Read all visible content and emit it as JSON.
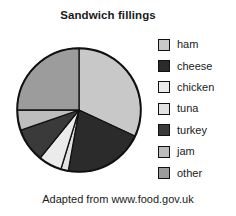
{
  "chart_data": {
    "type": "pie",
    "title": "Sandwich fillings",
    "caption": "Adapted from www.food.gov.uk",
    "xlabel": "",
    "ylabel": "",
    "legend_position": "right",
    "grid": false,
    "start_angle_deg": 0,
    "direction": "clockwise",
    "categories": [
      "ham",
      "cheese",
      "chicken",
      "tuna",
      "turkey",
      "jam",
      "other"
    ],
    "values": [
      32,
      21,
      6,
      2,
      9,
      5,
      25
    ],
    "unit": "percent",
    "slices": [
      {
        "label": "ham",
        "value": 32,
        "start_deg": 0,
        "end_deg": 115,
        "color": "#c8c8c8"
      },
      {
        "label": "cheese",
        "value": 21,
        "start_deg": 115,
        "end_deg": 190,
        "color": "#2b2b2b"
      },
      {
        "label": "tuna",
        "value": 2,
        "start_deg": 190,
        "end_deg": 197,
        "color": "#e2e2e2"
      },
      {
        "label": "chicken",
        "value": 6,
        "start_deg": 197,
        "end_deg": 219,
        "color": "#ebebeb"
      },
      {
        "label": "turkey",
        "value": 9,
        "start_deg": 219,
        "end_deg": 251,
        "color": "#3a3a3a"
      },
      {
        "label": "jam",
        "value": 5,
        "start_deg": 251,
        "end_deg": 270,
        "color": "#bdbdbd"
      },
      {
        "label": "other",
        "value": 25,
        "start_deg": 270,
        "end_deg": 360,
        "color": "#9c9c9c"
      }
    ],
    "colors": {
      "ham": "#c8c8c8",
      "cheese": "#2b2b2b",
      "chicken": "#ebebeb",
      "tuna": "#e2e2e2",
      "turkey": "#3a3a3a",
      "jam": "#bdbdbd",
      "other": "#9c9c9c",
      "outline": "#111111",
      "background": "#ffffff",
      "text": "#1a1a1a"
    }
  },
  "legend": {
    "items": [
      {
        "label": "ham",
        "color": "#c8c8c8"
      },
      {
        "label": "cheese",
        "color": "#2b2b2b"
      },
      {
        "label": "chicken",
        "color": "#ebebeb"
      },
      {
        "label": "tuna",
        "color": "#e2e2e2"
      },
      {
        "label": "turkey",
        "color": "#3a3a3a"
      },
      {
        "label": "jam",
        "color": "#bdbdbd"
      },
      {
        "label": "other",
        "color": "#9c9c9c"
      }
    ]
  }
}
